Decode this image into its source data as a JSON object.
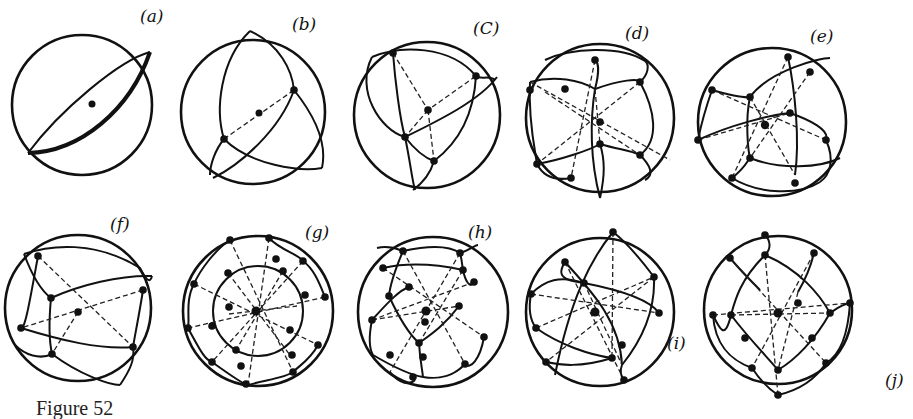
{
  "figure": {
    "caption": "Figure 52",
    "panels": [
      {
        "id": "a",
        "label": "(a)",
        "cx": 82,
        "cy": 105,
        "r": 70,
        "vertices": 1
      },
      {
        "id": "b",
        "label": "(b)",
        "cx": 253,
        "cy": 112,
        "r": 72,
        "vertices": 3
      },
      {
        "id": "c",
        "label": "(C)",
        "cx": 427,
        "cy": 115,
        "r": 73,
        "vertices": 5
      },
      {
        "id": "d",
        "label": "(d)",
        "cx": 600,
        "cy": 118,
        "r": 74,
        "vertices": 9
      },
      {
        "id": "e",
        "label": "(e)",
        "cx": 772,
        "cy": 122,
        "r": 74,
        "vertices": 13
      },
      {
        "id": "f",
        "label": "(f)",
        "cx": 78,
        "cy": 308,
        "r": 73,
        "vertices": 7
      },
      {
        "id": "g",
        "label": "(g)",
        "cx": 258,
        "cy": 311,
        "r": 75,
        "vertices": 21
      },
      {
        "id": "h",
        "label": "(h)",
        "cx": 433,
        "cy": 312,
        "r": 75,
        "vertices": 17
      },
      {
        "id": "i",
        "label": "(i)",
        "cx": 600,
        "cy": 312,
        "r": 74,
        "vertices": 12
      },
      {
        "id": "j",
        "label": "(j)",
        "cx": 778,
        "cy": 310,
        "r": 74,
        "vertices": 16
      }
    ]
  }
}
